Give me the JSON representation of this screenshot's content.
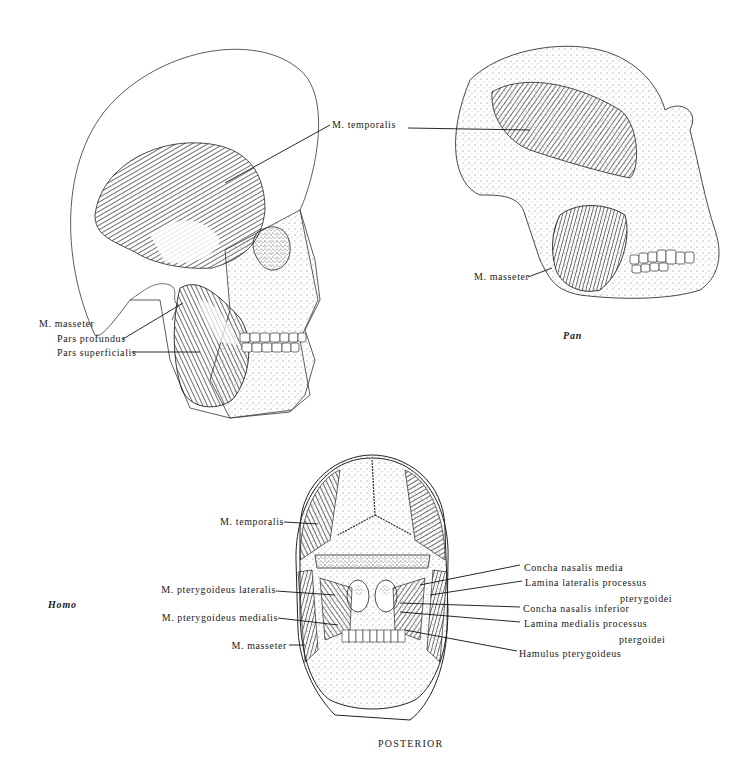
{
  "figure": {
    "species_labels": {
      "homo": "Homo",
      "pan": "Pan"
    },
    "view_label": "POSTERIOR",
    "colors": {
      "ink": "#1a1a1a",
      "background": "#ffffff",
      "muscle_fill": "#3a3a3a",
      "bone_stipple": "#8a8a8a"
    }
  },
  "homo_lateral": {
    "labels": {
      "temporalis": "M. temporalis",
      "masseter": "M. masseter",
      "pars_profundus": "Pars profundus",
      "pars_superficialis": "Pars superficialis"
    }
  },
  "pan_lateral": {
    "labels": {
      "masseter": "M. masseter"
    }
  },
  "homo_posterior": {
    "left_labels": {
      "temporalis": "M. temporalis",
      "pterygoideus_lateralis": "M. pterygoideus lateralis",
      "pterygoideus_medialis": "M. pterygoideus medialis",
      "masseter": "M. masseter"
    },
    "right_labels": {
      "concha_media": "Concha nasalis media",
      "lamina_lateralis_1": "Lamina lateralis processus",
      "lamina_lateralis_2": "pterygoidei",
      "concha_inferior": "Concha nasalis inferior",
      "lamina_medialis_1": "Lamina medialis processus",
      "lamina_medialis_2": "ptergoidei",
      "hamulus": "Hamulus pterygoideus"
    }
  }
}
